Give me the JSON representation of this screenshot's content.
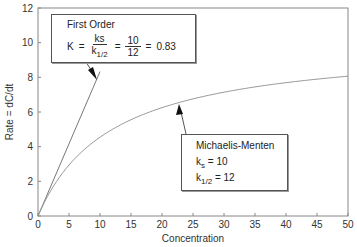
{
  "chart_data": {
    "type": "line",
    "title": "",
    "xlabel": "Concentration",
    "ylabel": "Rate = dC/dt",
    "xlim": [
      0,
      50
    ],
    "ylim": [
      0,
      12
    ],
    "x_ticks": [
      0,
      5,
      10,
      15,
      20,
      25,
      30,
      35,
      40,
      45,
      50
    ],
    "y_ticks": [
      0,
      2,
      4,
      6,
      8,
      10,
      12
    ],
    "grid": false,
    "legend": null,
    "series": [
      {
        "name": "First Order",
        "equation": "rate = 0.83 * C",
        "x": [
          0,
          10
        ],
        "values": [
          0,
          8.33
        ]
      },
      {
        "name": "Michaelis-Menten",
        "equation": "rate = 10 * C / (12 + C)",
        "x": [
          0,
          2,
          5,
          10,
          15,
          20,
          25,
          30,
          35,
          40,
          45,
          50
        ],
        "values": [
          0,
          1.43,
          2.94,
          4.55,
          5.56,
          6.25,
          6.76,
          7.14,
          7.45,
          7.69,
          7.89,
          8.06
        ]
      }
    ],
    "annotations": [
      {
        "title": "First Order",
        "k_label": "K",
        "num_symbol": "ks",
        "den_symbol": "k",
        "den_sub": "1/2",
        "num_value": "10",
        "den_value": "12",
        "result": "0.83",
        "eq": "=",
        "points_to": "First Order line"
      },
      {
        "title": "Michaelis-Menten",
        "ks_label": "k",
        "ks_sub": "s",
        "ks_value": "= 10",
        "khalf_label": "k",
        "khalf_sub": "1/2",
        "khalf_value": "= 12",
        "points_to": "Michaelis-Menten curve"
      }
    ]
  },
  "plot": {
    "left": 38,
    "top": 8,
    "right": 348,
    "bottom": 216
  },
  "colors": {
    "axis": "#888888",
    "first_order_line": "#777777",
    "mm_curve": "#999999",
    "arrow": "#111111"
  }
}
